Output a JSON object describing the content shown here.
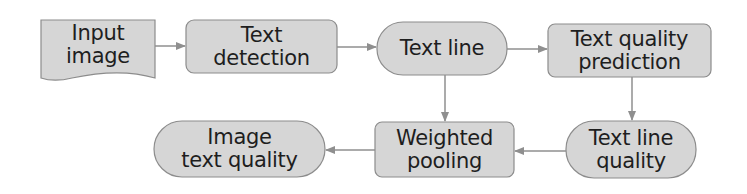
{
  "diagram": {
    "type": "flowchart",
    "colors": {
      "node_fill": "#d6d6d6",
      "node_stroke": "#8c8c8c",
      "edge": "#8f8f8f",
      "text": "#1e1e1e"
    },
    "nodes": [
      {
        "id": "input_image",
        "shape": "document",
        "lines": [
          "Input",
          "image"
        ]
      },
      {
        "id": "text_detection",
        "shape": "rounded-rect",
        "lines": [
          "Text",
          "detection"
        ]
      },
      {
        "id": "text_line",
        "shape": "pill",
        "lines": [
          "Text line"
        ]
      },
      {
        "id": "text_quality_prediction",
        "shape": "rounded-rect",
        "lines": [
          "Text quality",
          "prediction"
        ]
      },
      {
        "id": "text_line_quality",
        "shape": "pill",
        "lines": [
          "Text line",
          "quality"
        ]
      },
      {
        "id": "weighted_pooling",
        "shape": "rounded-rect",
        "lines": [
          "Weighted",
          "pooling"
        ]
      },
      {
        "id": "image_text_quality",
        "shape": "pill",
        "lines": [
          "Image",
          "text quality"
        ]
      }
    ],
    "edges": [
      {
        "from": "input_image",
        "to": "text_detection"
      },
      {
        "from": "text_detection",
        "to": "text_line"
      },
      {
        "from": "text_line",
        "to": "text_quality_prediction"
      },
      {
        "from": "text_line",
        "to": "weighted_pooling"
      },
      {
        "from": "text_quality_prediction",
        "to": "text_line_quality"
      },
      {
        "from": "text_line_quality",
        "to": "weighted_pooling"
      },
      {
        "from": "weighted_pooling",
        "to": "image_text_quality"
      }
    ]
  }
}
